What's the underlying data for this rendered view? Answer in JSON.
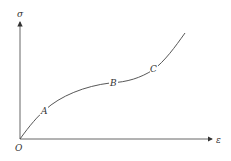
{
  "diagram": {
    "y_axis_label": "σ",
    "x_axis_label": "ε",
    "origin_label": "O",
    "points": [
      {
        "label": "A"
      },
      {
        "label": "B"
      },
      {
        "label": "C"
      }
    ],
    "colors": {
      "line": "#444444",
      "axis": "#555555",
      "background": "#ffffff"
    }
  }
}
